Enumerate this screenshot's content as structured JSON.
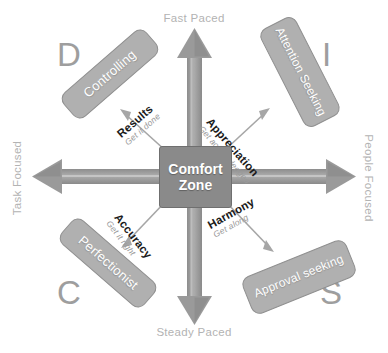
{
  "diagram": {
    "center": {
      "line1": "Comfort",
      "line2": "Zone"
    },
    "axes": {
      "top": "Fast Paced",
      "bottom": "Steady Paced",
      "left": "Task Focused",
      "right": "People Focused"
    },
    "quadrants": [
      {
        "letter": "D",
        "style_label": "Controlling",
        "driver": "Results",
        "driver_sub": "Get it done"
      },
      {
        "letter": "I",
        "style_label": "Attention Seeking",
        "driver": "Appreciation",
        "driver_sub": "Get acknowledged"
      },
      {
        "letter": "C",
        "style_label": "Perfectionist",
        "driver": "Accuracy",
        "driver_sub": "Get it right"
      },
      {
        "letter": "S",
        "style_label": "Approval seeking",
        "driver": "Harmony",
        "driver_sub": "Get along"
      }
    ],
    "colors": {
      "box_fill": "#b0b0b0",
      "box_border": "#8f8f8f",
      "center_fill": "#8a8a8a",
      "arrow": "#9a9a9a",
      "axis_text": "#b3b3b3",
      "letter_text": "#9e9e9e",
      "driver_text": "#1a1a1a",
      "driver_sub_text": "#9a9a9a",
      "background": "#ffffff"
    }
  }
}
